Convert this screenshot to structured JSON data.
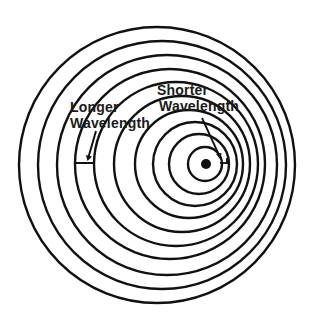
{
  "diagram": {
    "type": "concentric-wave-fronts",
    "colors": {
      "stroke": "#111111",
      "background": "#ffffff"
    },
    "source": {
      "cx": 206,
      "cy": 164,
      "r": 5
    },
    "wavefronts": [
      {
        "cx": 205,
        "cy": 164,
        "r": 17
      },
      {
        "cx": 199,
        "cy": 164,
        "r": 30
      },
      {
        "cx": 195,
        "cy": 164,
        "r": 42
      },
      {
        "cx": 189,
        "cy": 164,
        "r": 54
      },
      {
        "cx": 182,
        "cy": 164,
        "r": 68
      },
      {
        "cx": 176,
        "cy": 164,
        "r": 82
      },
      {
        "cx": 170,
        "cy": 164,
        "r": 95
      },
      {
        "cx": 167,
        "cy": 165,
        "r": 110
      },
      {
        "cx": 162,
        "cy": 165,
        "r": 124
      },
      {
        "cx": 157,
        "cy": 165,
        "r": 138
      }
    ],
    "labels": {
      "longer": {
        "line1": "Longer",
        "line2": "Wavelength"
      },
      "shorter": {
        "line1": "Shorter",
        "line2": "Wavelength"
      }
    }
  }
}
